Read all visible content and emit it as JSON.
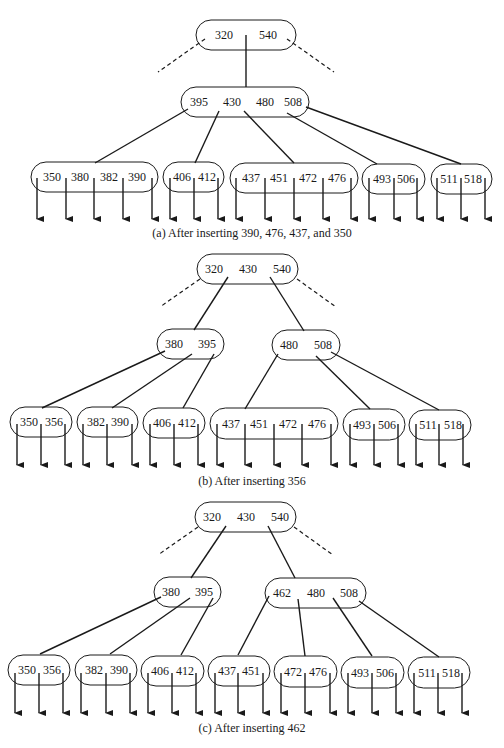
{
  "figure": {
    "panels": [
      {
        "id": "a",
        "caption": "(a) After inserting 390, 476, 437, and 350",
        "caption_y": 237,
        "root": {
          "x": 196,
          "y": 20,
          "w": 100,
          "h": 30,
          "keys": [
            {
              "v": "320",
              "x": 224
            },
            {
              "v": "540",
              "x": 268
            }
          ]
        },
        "dashed": [
          {
            "x1": 205,
            "y1": 39,
            "x2": 158,
            "y2": 72
          },
          {
            "x1": 287,
            "y1": 39,
            "x2": 334,
            "y2": 72
          }
        ],
        "inner": [
          {
            "x": 181,
            "y": 87,
            "w": 128,
            "h": 30,
            "keys": [
              {
                "v": "395",
                "x": 199
              },
              {
                "v": "430",
                "x": 232
              },
              {
                "v": "480",
                "x": 265
              },
              {
                "v": "508",
                "x": 293
              }
            ]
          }
        ],
        "root_edges": [
          {
            "x1": 246,
            "y1": 35,
            "x2": 246,
            "y2": 87
          }
        ],
        "inner_edges": [
          {
            "x1": 188,
            "y1": 109,
            "x2": 95,
            "y2": 163
          },
          {
            "x1": 219,
            "y1": 111,
            "x2": 195,
            "y2": 163
          },
          {
            "x1": 244,
            "y1": 111,
            "x2": 294,
            "y2": 163
          },
          {
            "x1": 287,
            "y1": 113,
            "x2": 377,
            "y2": 164
          },
          {
            "x1": 306,
            "y1": 107,
            "x2": 461,
            "y2": 164
          }
        ],
        "leaves": [
          {
            "x": 31,
            "y": 162,
            "w": 127,
            "h": 30,
            "keys": [
              {
                "v": "350",
                "x": 52
              },
              {
                "v": "380",
                "x": 80
              },
              {
                "v": "382",
                "x": 109
              },
              {
                "v": "390",
                "x": 137
              }
            ],
            "ptrs": [
              37,
              66,
              94,
              123,
              152
            ]
          },
          {
            "x": 163,
            "y": 162,
            "w": 61,
            "h": 30,
            "keys": [
              {
                "v": "406",
                "x": 182
              },
              {
                "v": "412",
                "x": 207
              }
            ],
            "ptrs": [
              170,
              194,
              218
            ]
          },
          {
            "x": 230,
            "y": 163,
            "w": 128,
            "h": 30,
            "keys": [
              {
                "v": "437",
                "x": 251
              },
              {
                "v": "451",
                "x": 279
              },
              {
                "v": "472",
                "x": 308
              },
              {
                "v": "476",
                "x": 337
              }
            ],
            "ptrs": [
              236,
              265,
              294,
              323,
              351
            ]
          },
          {
            "x": 362,
            "y": 164,
            "w": 63,
            "h": 30,
            "keys": [
              {
                "v": "493",
                "x": 382
              },
              {
                "v": "506",
                "x": 406
              }
            ],
            "ptrs": [
              369,
              394,
              417
            ]
          },
          {
            "x": 431,
            "y": 164,
            "w": 61,
            "h": 30,
            "keys": [
              {
                "v": "511",
                "x": 449
              },
              {
                "v": "518",
                "x": 473
              }
            ],
            "ptrs": [
              437,
              461,
              485
            ]
          }
        ],
        "ptr_top": 178,
        "ptr_bottom": 220
      },
      {
        "id": "b",
        "caption": "(b) After inserting 356",
        "caption_y": 485,
        "root": {
          "x": 197,
          "y": 254,
          "w": 101,
          "h": 30,
          "keys": [
            {
              "v": "320",
              "x": 214
            },
            {
              "v": "430",
              "x": 248
            },
            {
              "v": "540",
              "x": 282
            }
          ]
        },
        "dashed": [
          {
            "x1": 200,
            "y1": 279,
            "x2": 160,
            "y2": 307
          },
          {
            "x1": 297,
            "y1": 279,
            "x2": 336,
            "y2": 307
          }
        ],
        "inner": [
          {
            "x": 157,
            "y": 329,
            "w": 67,
            "h": 30,
            "keys": [
              {
                "v": "380",
                "x": 174
              },
              {
                "v": "395",
                "x": 207
              }
            ]
          },
          {
            "x": 272,
            "y": 330,
            "w": 68,
            "h": 30,
            "keys": [
              {
                "v": "480",
                "x": 289
              },
              {
                "v": "508",
                "x": 323
              }
            ]
          }
        ],
        "root_edges": [
          {
            "x1": 228,
            "y1": 277,
            "x2": 194,
            "y2": 330
          },
          {
            "x1": 270,
            "y1": 277,
            "x2": 304,
            "y2": 331
          }
        ],
        "inner_edges": [
          {
            "x1": 165,
            "y1": 351,
            "x2": 42,
            "y2": 408
          },
          {
            "x1": 192,
            "y1": 354,
            "x2": 112,
            "y2": 408
          },
          {
            "x1": 214,
            "y1": 354,
            "x2": 183,
            "y2": 408
          },
          {
            "x1": 278,
            "y1": 354,
            "x2": 245,
            "y2": 409
          },
          {
            "x1": 316,
            "y1": 356,
            "x2": 370,
            "y2": 409
          },
          {
            "x1": 331,
            "y1": 352,
            "x2": 439,
            "y2": 410
          }
        ],
        "leaves": [
          {
            "x": 10,
            "y": 407,
            "w": 62,
            "h": 30,
            "keys": [
              {
                "v": "350",
                "x": 29
              },
              {
                "v": "356",
                "x": 54
              }
            ],
            "ptrs": [
              17,
              41,
              65
            ]
          },
          {
            "x": 77,
            "y": 407,
            "w": 61,
            "h": 30,
            "keys": [
              {
                "v": "382",
                "x": 96
              },
              {
                "v": "390",
                "x": 120
              }
            ],
            "ptrs": [
              83,
              107,
              132
            ]
          },
          {
            "x": 143,
            "y": 408,
            "w": 62,
            "h": 30,
            "keys": [
              {
                "v": "406",
                "x": 162
              },
              {
                "v": "412",
                "x": 187
              }
            ],
            "ptrs": [
              150,
              174,
              198
            ]
          },
          {
            "x": 210,
            "y": 408,
            "w": 128,
            "h": 31,
            "keys": [
              {
                "v": "437",
                "x": 231
              },
              {
                "v": "451",
                "x": 259
              },
              {
                "v": "472",
                "x": 288
              },
              {
                "v": "476",
                "x": 317
              }
            ],
            "ptrs": [
              217,
              245,
              274,
              302,
              331
            ]
          },
          {
            "x": 343,
            "y": 409,
            "w": 62,
            "h": 31,
            "keys": [
              {
                "v": "493",
                "x": 362
              },
              {
                "v": "506",
                "x": 387
              }
            ],
            "ptrs": [
              350,
              374,
              398
            ]
          },
          {
            "x": 409,
            "y": 410,
            "w": 62,
            "h": 30,
            "keys": [
              {
                "v": "511",
                "x": 428
              },
              {
                "v": "518",
                "x": 453
              }
            ],
            "ptrs": [
              416,
              439,
              463
            ]
          }
        ],
        "ptr_top": 424,
        "ptr_bottom": 466
      },
      {
        "id": "c",
        "caption": "(c) After inserting 462",
        "caption_y": 732,
        "root": {
          "x": 195,
          "y": 502,
          "w": 101,
          "h": 30,
          "keys": [
            {
              "v": "320",
              "x": 212
            },
            {
              "v": "430",
              "x": 246
            },
            {
              "v": "540",
              "x": 280
            }
          ]
        },
        "dashed": [
          {
            "x1": 198,
            "y1": 527,
            "x2": 158,
            "y2": 555
          },
          {
            "x1": 294,
            "y1": 527,
            "x2": 333,
            "y2": 555
          }
        ],
        "inner": [
          {
            "x": 154,
            "y": 577,
            "w": 67,
            "h": 30,
            "keys": [
              {
                "v": "380",
                "x": 171
              },
              {
                "v": "395",
                "x": 204
              }
            ]
          },
          {
            "x": 265,
            "y": 578,
            "w": 101,
            "h": 30,
            "keys": [
              {
                "v": "462",
                "x": 282
              },
              {
                "v": "480",
                "x": 316
              },
              {
                "v": "508",
                "x": 349
              }
            ]
          }
        ],
        "root_edges": [
          {
            "x1": 226,
            "y1": 526,
            "x2": 191,
            "y2": 578
          },
          {
            "x1": 268,
            "y1": 526,
            "x2": 295,
            "y2": 578
          }
        ],
        "inner_edges": [
          {
            "x1": 161,
            "y1": 597,
            "x2": 40,
            "y2": 654
          },
          {
            "x1": 190,
            "y1": 598,
            "x2": 110,
            "y2": 654
          },
          {
            "x1": 213,
            "y1": 598,
            "x2": 181,
            "y2": 655
          },
          {
            "x1": 269,
            "y1": 596,
            "x2": 238,
            "y2": 655
          },
          {
            "x1": 298,
            "y1": 599,
            "x2": 305,
            "y2": 656
          },
          {
            "x1": 333,
            "y1": 598,
            "x2": 372,
            "y2": 656
          },
          {
            "x1": 359,
            "y1": 601,
            "x2": 439,
            "y2": 657
          }
        ],
        "leaves": [
          {
            "x": 8,
            "y": 655,
            "w": 62,
            "h": 30,
            "keys": [
              {
                "v": "350",
                "x": 27
              },
              {
                "v": "356",
                "x": 52
              }
            ],
            "ptrs": [
              15,
              39,
              63
            ]
          },
          {
            "x": 75,
            "y": 655,
            "w": 62,
            "h": 30,
            "keys": [
              {
                "v": "382",
                "x": 94
              },
              {
                "v": "390",
                "x": 119
              }
            ],
            "ptrs": [
              81,
              106,
              130
            ]
          },
          {
            "x": 141,
            "y": 656,
            "w": 63,
            "h": 30,
            "keys": [
              {
                "v": "406",
                "x": 160
              },
              {
                "v": "412",
                "x": 185
              }
            ],
            "ptrs": [
              148,
              172,
              196
            ]
          },
          {
            "x": 208,
            "y": 656,
            "w": 62,
            "h": 30,
            "keys": [
              {
                "v": "437",
                "x": 227
              },
              {
                "v": "451",
                "x": 251
              }
            ],
            "ptrs": [
              215,
              238,
              263
            ]
          },
          {
            "x": 274,
            "y": 656,
            "w": 63,
            "h": 31,
            "keys": [
              {
                "v": "472",
                "x": 293
              },
              {
                "v": "476",
                "x": 318
              }
            ],
            "ptrs": [
              281,
              305,
              330
            ]
          },
          {
            "x": 341,
            "y": 657,
            "w": 63,
            "h": 31,
            "keys": [
              {
                "v": "493",
                "x": 360
              },
              {
                "v": "506",
                "x": 385
              }
            ],
            "ptrs": [
              348,
              372,
              396
            ]
          },
          {
            "x": 408,
            "y": 657,
            "w": 62,
            "h": 31,
            "keys": [
              {
                "v": "511",
                "x": 427
              },
              {
                "v": "518",
                "x": 451
              }
            ],
            "ptrs": [
              414,
              438,
              462
            ]
          }
        ],
        "ptr_top": 673,
        "ptr_bottom": 714
      }
    ]
  }
}
